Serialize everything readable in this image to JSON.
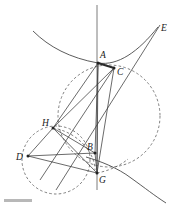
{
  "figure": {
    "background_color": "#ffffff",
    "width": 175,
    "height": 212,
    "colors": {
      "stroke": "#3a3a3a",
      "curve": "#4a4a4a",
      "dashed": "#555555",
      "label": "#1a1a1a",
      "thick_segment": "#2b2b2b",
      "footer_rule": "#b8b8b8"
    },
    "points": [
      {
        "id": "A",
        "label": "A",
        "x": 98,
        "y": 63,
        "label_x": 100,
        "label_y": 58
      },
      {
        "id": "C",
        "label": "C",
        "x": 114,
        "y": 68,
        "label_x": 118,
        "label_y": 74
      },
      {
        "id": "E",
        "label": "E",
        "x": 158,
        "y": 27,
        "label_x": 161,
        "label_y": 31
      },
      {
        "id": "H",
        "label": "H",
        "x": 53,
        "y": 128,
        "label_x": 43,
        "label_y": 125
      },
      {
        "id": "D",
        "label": "D",
        "x": 28,
        "y": 156,
        "label_x": 17,
        "label_y": 159
      },
      {
        "id": "B",
        "label": "B",
        "x": 95,
        "y": 153,
        "label_x": 88,
        "label_y": 149
      },
      {
        "id": "G",
        "label": "G",
        "x": 97,
        "y": 173,
        "label_x": 99,
        "label_y": 182
      }
    ],
    "segments": [
      {
        "name": "segment-A-C",
        "from": "A",
        "to": "C",
        "style": "thick"
      },
      {
        "name": "segment-A-H",
        "from": "A",
        "to": "H",
        "style": "solid"
      },
      {
        "name": "segment-A-G",
        "from": "A",
        "to": "G",
        "style": "solid"
      },
      {
        "name": "segment-A-B",
        "from": "A",
        "to": "B",
        "style": "solid"
      },
      {
        "name": "segment-C-G",
        "from": "C",
        "to": "G",
        "style": "solid"
      },
      {
        "name": "segment-C-H",
        "from": "C",
        "to": "H",
        "style": "solid"
      },
      {
        "name": "segment-H-D",
        "from": "H",
        "to": "D",
        "style": "solid"
      },
      {
        "name": "segment-H-B",
        "from": "H",
        "to": "B",
        "style": "solid"
      },
      {
        "name": "segment-H-G",
        "from": "H",
        "to": "G",
        "style": "solid"
      },
      {
        "name": "segment-D-B",
        "from": "D",
        "to": "B",
        "style": "solid"
      },
      {
        "name": "segment-D-G",
        "from": "D",
        "to": "G",
        "style": "solid"
      },
      {
        "name": "segment-B-G",
        "from": "B",
        "to": "G",
        "style": "solid"
      }
    ],
    "circles": [
      {
        "name": "large-dashed-circle",
        "cx": 109,
        "cy": 116,
        "r": 51,
        "style": "dashed"
      },
      {
        "name": "small-dashed-circle",
        "cx": 56,
        "cy": 160,
        "r": 34,
        "style": "dashed"
      }
    ],
    "curves": [
      {
        "name": "hyperbola-upper-branch",
        "description": "upper-left branch passing through A rising to E"
      },
      {
        "name": "hyperbola-lower-branch",
        "description": "lower branch passing near G descending right"
      }
    ],
    "axis": {
      "name": "vertical-axis",
      "x": 97,
      "y1": 5,
      "y2": 190
    },
    "ray": {
      "name": "ray-to-E",
      "from": "G",
      "to": "E"
    }
  }
}
